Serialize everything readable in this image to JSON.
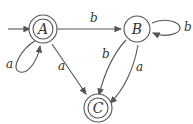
{
  "diagram": {
    "type": "finite-automaton",
    "states": [
      {
        "id": "A",
        "label": "A",
        "start": true,
        "accepting": true
      },
      {
        "id": "B",
        "label": "B",
        "start": false,
        "accepting": false
      },
      {
        "id": "C",
        "label": "C",
        "start": false,
        "accepting": true
      }
    ],
    "transitions": [
      {
        "from": "A",
        "to": "A",
        "label": "a"
      },
      {
        "from": "A",
        "to": "B",
        "label": "b"
      },
      {
        "from": "A",
        "to": "C",
        "label": "a"
      },
      {
        "from": "B",
        "to": "B",
        "label": "b"
      },
      {
        "from": "B",
        "to": "C",
        "label": "b"
      },
      {
        "from": "B",
        "to": "C",
        "label": "a"
      }
    ],
    "edge_labels": {
      "a_loop": "a",
      "a_to_b": "b",
      "a_to_c": "a",
      "b_loop": "b",
      "b_to_c_b": "b",
      "b_to_c_a": "a"
    },
    "colors": {
      "stroke": "#555555",
      "text": "#333333",
      "background": "#ffffff"
    }
  }
}
